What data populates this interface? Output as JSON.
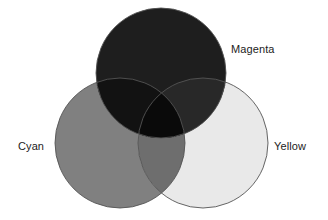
{
  "diagram": {
    "type": "venn",
    "title": "",
    "background_color": "#ffffff",
    "label_color": "#1c1c1c",
    "stroke_color": "#555555",
    "labels": {
      "magenta": "Magenta",
      "cyan": "Cyan",
      "yellow": "Yellow"
    },
    "circles": [
      {
        "name": "magenta",
        "cx": 161,
        "cy": 73,
        "r": 65,
        "fill": "#1e1e1e"
      },
      {
        "name": "cyan",
        "cx": 120,
        "cy": 143,
        "r": 65,
        "fill": "#808080"
      },
      {
        "name": "yellow",
        "cx": 203,
        "cy": 143,
        "r": 65,
        "fill": "#e9e9e9"
      }
    ],
    "regions": [
      {
        "name": "magenta-only",
        "fill": "#1e1e1e"
      },
      {
        "name": "cyan-only",
        "fill": "#808080"
      },
      {
        "name": "yellow-only",
        "fill": "#e9e9e9"
      },
      {
        "name": "cyan-magenta",
        "fill": "#121212"
      },
      {
        "name": "magenta-yellow",
        "fill": "#282828"
      },
      {
        "name": "cyan-yellow",
        "fill": "#6e6e6e"
      },
      {
        "name": "cyan-magenta-yellow",
        "fill": "#0a0a0a"
      }
    ]
  }
}
